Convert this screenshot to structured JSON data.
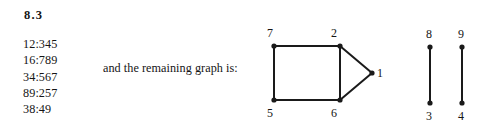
{
  "heading": "8.3",
  "adjacency_list": [
    "12:345",
    "16:789",
    "34:567",
    "89:257",
    "38:49"
  ],
  "caption": "and the remaining graph is:",
  "colors": {
    "ink": "#151515",
    "edge": "#1a1a1a",
    "background": "#ffffff"
  },
  "chart_data": {
    "type": "diagram",
    "title": "",
    "subtitle": "and the remaining graph is:",
    "graph_kind": "undirected-graph",
    "components": [
      {
        "name": "component-1",
        "vertices": [
          "7",
          "2",
          "1",
          "6",
          "5"
        ],
        "edges": [
          [
            "7",
            "2"
          ],
          [
            "7",
            "5"
          ],
          [
            "2",
            "6"
          ],
          [
            "2",
            "1"
          ],
          [
            "6",
            "1"
          ],
          [
            "5",
            "6"
          ]
        ]
      },
      {
        "name": "component-2",
        "vertices": [
          "8",
          "3"
        ],
        "edges": [
          [
            "8",
            "3"
          ]
        ]
      },
      {
        "name": "component-3",
        "vertices": [
          "9",
          "4"
        ],
        "edges": [
          [
            "9",
            "4"
          ]
        ]
      }
    ],
    "nodes": [
      {
        "id": "7",
        "label": "7",
        "x": 19,
        "y": 28,
        "label_dx": -7,
        "label_dy": -19
      },
      {
        "id": "2",
        "label": "2",
        "x": 85,
        "y": 28,
        "label_dx": -9,
        "label_dy": -19
      },
      {
        "id": "1",
        "label": "1",
        "x": 117,
        "y": 55,
        "label_dx": 5,
        "label_dy": -6
      },
      {
        "id": "5",
        "label": "5",
        "x": 19,
        "y": 82,
        "label_dx": -7,
        "label_dy": 7
      },
      {
        "id": "6",
        "label": "6",
        "x": 85,
        "y": 82,
        "label_dx": -9,
        "label_dy": 7
      },
      {
        "id": "8",
        "label": "8",
        "x": 175,
        "y": 29,
        "label_dx": -4,
        "label_dy": -19
      },
      {
        "id": "3",
        "label": "3",
        "x": 175,
        "y": 85,
        "label_dx": -4,
        "label_dy": 7
      },
      {
        "id": "9",
        "label": "9",
        "x": 207,
        "y": 29,
        "label_dx": -4,
        "label_dy": -19
      },
      {
        "id": "4",
        "label": "4",
        "x": 207,
        "y": 85,
        "label_dx": -4,
        "label_dy": 7
      }
    ],
    "edges": [
      {
        "from": "7",
        "to": "2"
      },
      {
        "from": "7",
        "to": "5"
      },
      {
        "from": "2",
        "to": "6"
      },
      {
        "from": "2",
        "to": "1"
      },
      {
        "from": "6",
        "to": "1"
      },
      {
        "from": "5",
        "to": "6"
      },
      {
        "from": "8",
        "to": "3"
      },
      {
        "from": "9",
        "to": "4"
      }
    ],
    "node_radius": 2.6,
    "edge_width": 2
  }
}
